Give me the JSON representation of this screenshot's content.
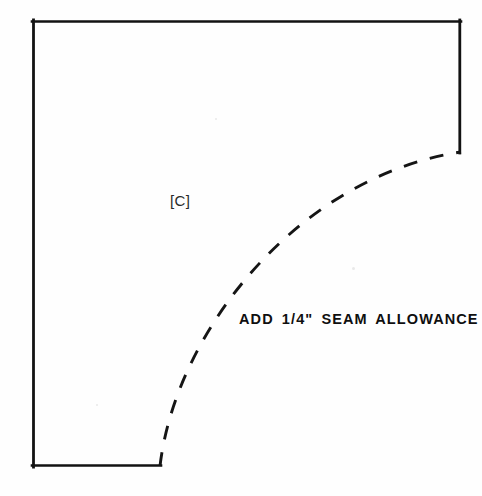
{
  "document": {
    "type": "sewing-pattern-piece",
    "background_color": "#fefefe",
    "ink_color": "#111111"
  },
  "pattern": {
    "piece_label": "[C]",
    "seam_allowance_note": "ADD 1/4\" SEAM ALLOWANCE",
    "outline": {
      "description": "solid cut-edge border, open at lower-right",
      "stroke_color": "#121212",
      "stroke_width": 2.6,
      "top_edge": {
        "x1": 32,
        "y1": 21,
        "x2": 461,
        "y2": 21
      },
      "left_edge": {
        "x1": 33,
        "y1": 21,
        "x2": 33,
        "y2": 466
      },
      "bottom_edge": {
        "x1": 33,
        "y1": 466,
        "x2": 161,
        "y2": 466
      },
      "right_edge": {
        "x1": 460,
        "y1": 21,
        "x2": 460,
        "y2": 153
      }
    },
    "curve": {
      "description": "dashed concave arc joining bottom edge end to right edge end",
      "stroke_color": "#151515",
      "stroke_width": 2.8,
      "dash_pattern": "13 13",
      "start": {
        "x": 160,
        "y": 466
      },
      "end": {
        "x": 461,
        "y": 152
      },
      "control_1": {
        "x": 176,
        "y": 330
      },
      "control_2": {
        "x": 300,
        "y": 176
      }
    }
  }
}
